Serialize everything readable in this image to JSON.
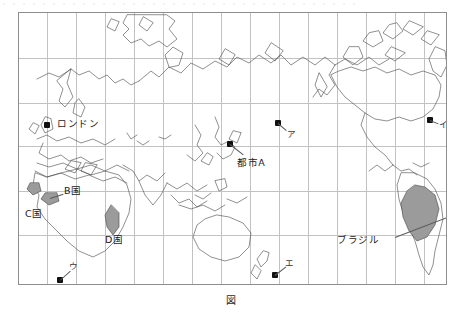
{
  "figure": {
    "caption": "図",
    "top_cut_text": "・・・・・・・・・・・・・・・・・・・・・・・・・・・・・・・・・・・・"
  },
  "map": {
    "projection_note": "world-map-outline",
    "frame": {
      "x": 18,
      "y": 12,
      "width": 427,
      "height": 271
    },
    "grid": {
      "columns": 15,
      "rows": 6,
      "visible": true,
      "color": "#c2c2c2"
    },
    "border_color": "#8e8e8e",
    "coastline_color": "#4a4a4a",
    "shade_color": "#9b9b9b",
    "background": "#ffffff"
  },
  "markers": [
    {
      "id": "london",
      "label": "ロンドン",
      "type": "city",
      "x": 28,
      "y": 112,
      "label_x": 38,
      "label_y": 111,
      "leader": false
    },
    {
      "id": "city-a",
      "label": "都市A",
      "type": "city",
      "x": 211,
      "y": 131,
      "label_x": 218,
      "label_y": 150,
      "leader": true,
      "leader_to_x": 216,
      "leader_to_y": 146
    },
    {
      "id": "point-a",
      "label": "ア",
      "type": "location",
      "x": 259,
      "y": 110,
      "label_x": 268,
      "label_y": 121,
      "leader": true,
      "leader_to_x": 266,
      "leader_to_y": 118
    },
    {
      "id": "point-i",
      "label": "イ",
      "type": "location",
      "x": 411,
      "y": 107,
      "label_x": 421,
      "label_y": 113,
      "leader": true,
      "leader_to_x": 419,
      "leader_to_y": 111
    },
    {
      "id": "point-u",
      "label": "ウ",
      "type": "location",
      "x": 41,
      "y": 267,
      "label_x": 50,
      "label_y": 254,
      "leader": true,
      "leader_to_x": 49,
      "leader_to_y": 258
    },
    {
      "id": "point-e",
      "label": "エ",
      "type": "location",
      "x": 256,
      "y": 262,
      "label_x": 267,
      "label_y": 251,
      "leader": true,
      "leader_to_x": 265,
      "leader_to_y": 254
    }
  ],
  "country_labels": [
    {
      "id": "country-b",
      "label": "B国",
      "x": 44,
      "y": 176,
      "leader": true,
      "leader_to_x": 31,
      "leader_to_y": 184
    },
    {
      "id": "country-c",
      "label": "C国",
      "x": 12,
      "y": 201,
      "leader": false
    },
    {
      "id": "country-d",
      "label": "D国",
      "x": 89,
      "y": 224,
      "leader": false
    },
    {
      "id": "brazil",
      "label": "ブラジル",
      "x": 336,
      "y": 228,
      "leader": true,
      "leader_to_x": 390,
      "leader_to_y": 207
    }
  ],
  "shaded_regions": [
    {
      "id": "region-b-west-africa-1",
      "name": "B国"
    },
    {
      "id": "region-b-west-africa-2",
      "name": "B国"
    },
    {
      "id": "region-d-madagascar",
      "name": "D国"
    },
    {
      "id": "region-brazil",
      "name": "ブラジル"
    }
  ]
}
